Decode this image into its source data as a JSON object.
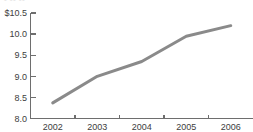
{
  "chart_data": {
    "type": "line",
    "title": "",
    "subtitle": "",
    "xlabel": "",
    "ylabel": "",
    "x": [
      "2002",
      "2003",
      "2004",
      "2005",
      "2006"
    ],
    "categories": [
      "2002",
      "2003",
      "2004",
      "2005",
      "2006"
    ],
    "values": [
      8.37,
      9.0,
      9.35,
      9.95,
      10.2
    ],
    "series": [
      {
        "name": "",
        "values": [
          8.37,
          9.0,
          9.35,
          9.95,
          10.2
        ]
      }
    ],
    "ylim": [
      8.0,
      10.5
    ],
    "y_ticks": [
      8.0,
      8.5,
      9.0,
      9.5,
      10.0,
      10.5
    ],
    "y_tick_labels": [
      "8.0",
      "8.5",
      "9.0",
      "9.5",
      "10.0",
      "$10.5"
    ],
    "x_tick_labels": [
      "2002",
      "2003",
      "2004",
      "2005",
      "2006"
    ],
    "grid": false,
    "legend": "none",
    "line_color": "#8a8a8a",
    "axis_color": "#6e6e6e",
    "text_color": "#3d3d3d",
    "background": "#ffffff"
  },
  "clipped_header": {
    "text": "• •• ••"
  }
}
